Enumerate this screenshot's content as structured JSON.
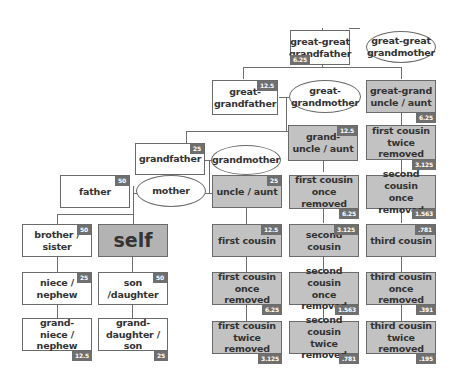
{
  "diagram": {
    "colors": {
      "box_border": "#6a6a6a",
      "gray_box": "#c2c2c2",
      "self_box": "#b3b3b3",
      "badge": "#6f6f6f",
      "line": "#6e6e6e"
    },
    "nodes": {
      "gg_grandfather": {
        "label": "great-great\ngrandfather",
        "badge": "6.25"
      },
      "gg_grandmother": {
        "label": "great-great\ngrandmother"
      },
      "g_grandfather": {
        "label": "great-\ngrandfather",
        "badge": "12.5"
      },
      "g_grandmother": {
        "label": "great-\ngrandmother"
      },
      "gg_uncle": {
        "label": "great-grand\nuncle / aunt",
        "badge": "6.25"
      },
      "grandfather": {
        "label": "grandfather",
        "badge": "25"
      },
      "grandmother": {
        "label": "grandmother"
      },
      "grand_uncle": {
        "label": "grand-\nuncle / aunt",
        "badge": "12.5"
      },
      "fc_twice_top": {
        "label": "first cousin\ntwice removed",
        "badge": "3.125"
      },
      "father": {
        "label": "father",
        "badge": "50"
      },
      "mother": {
        "label": "mother"
      },
      "uncle": {
        "label": "uncle / aunt",
        "badge": "25"
      },
      "fc_once_mid": {
        "label": "first cousin\nonce removed",
        "badge": "6.25"
      },
      "sc_once_mid": {
        "label": "second cousin\nonce removed",
        "badge": "1.563"
      },
      "sibling": {
        "label": "brother / sister",
        "badge": "50"
      },
      "self": {
        "label": "self"
      },
      "first_cousin": {
        "label": "first cousin",
        "badge": "12.5"
      },
      "second_cousin": {
        "label": "second cousin",
        "badge": "3.125"
      },
      "third_cousin": {
        "label": "third cousin",
        "badge": ".781"
      },
      "niece": {
        "label": "niece / nephew",
        "badge": "25"
      },
      "child": {
        "label": "son /daughter",
        "badge": "50"
      },
      "fc_once_low": {
        "label": "first cousin\nonce removed",
        "badge": "6.25"
      },
      "sc_once_low": {
        "label": "second cousin\nonce removed",
        "badge": "1.563"
      },
      "tc_once_low": {
        "label": "third cousin\nonce removed",
        "badge": ".391"
      },
      "grandniece": {
        "label": "grand-\nniece / nephew",
        "badge": "12.5"
      },
      "grandchild": {
        "label": "grand-\ndaughter / son",
        "badge": "25"
      },
      "fc_twice_low": {
        "label": "first cousin\ntwice removed",
        "badge": "3.125"
      },
      "sc_twice_low": {
        "label": "second cousin\ntwice removed",
        "badge": ".781"
      },
      "tc_twice_low": {
        "label": "third cousin\ntwice removed",
        "badge": ".195"
      }
    }
  }
}
